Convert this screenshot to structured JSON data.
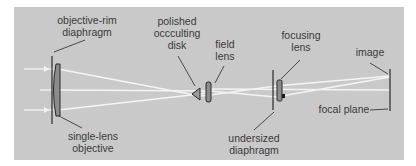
{
  "diagram": {
    "colors": {
      "background": "#c9c9c9",
      "rays": "#f4f4f4",
      "lines": "#2a2a2a",
      "lens_fill": "#8c8c8c",
      "text": "#3a3a3a"
    },
    "labels": {
      "objective_rim_diaphragm": "objective-rim\ndiaphragm",
      "single_lens_objective": "single-lens\nobjective",
      "polished_occulting_disk": "polished\noccculting\ndisk",
      "field_lens": "field\nlens",
      "undersized_diaphragm": "undersized\ndiaphragm",
      "focusing_lens": "focusing\nlens",
      "image": "image",
      "focal_plane": "focal plane"
    },
    "components": [
      {
        "name": "objective-rim diaphragm",
        "x": 52
      },
      {
        "name": "single-lens objective",
        "x": 57
      },
      {
        "name": "polished occulting disk",
        "x": 198
      },
      {
        "name": "field lens",
        "x": 208
      },
      {
        "name": "undersized diaphragm",
        "x": 274
      },
      {
        "name": "focusing lens",
        "x": 280
      },
      {
        "name": "focal plane",
        "x": 390
      }
    ]
  }
}
